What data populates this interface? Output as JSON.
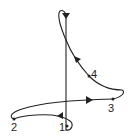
{
  "diagram": {
    "type": "thermodynamic-cycle-path",
    "stroke_color": "#222222",
    "background": "#ffffff",
    "points": [
      {
        "id": "1",
        "label": "1",
        "x": 67,
        "y": 126
      },
      {
        "id": "2",
        "label": "2",
        "x": 14,
        "y": 119
      },
      {
        "id": "3",
        "label": "3",
        "x": 113,
        "y": 99
      },
      {
        "id": "4",
        "label": "4",
        "x": 89,
        "y": 76
      }
    ],
    "arrows": [
      {
        "segment": "top-loop-to-1",
        "direction": "down"
      },
      {
        "segment": "1-to-2",
        "direction": "left"
      },
      {
        "segment": "2-to-3",
        "direction": "right"
      },
      {
        "segment": "3-4-to-top",
        "direction": "up-left"
      }
    ]
  }
}
